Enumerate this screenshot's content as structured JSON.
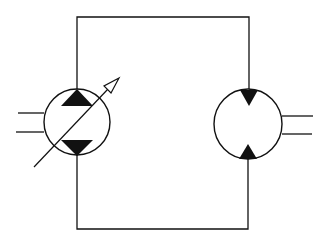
{
  "diagram": {
    "type": "hydraulic-circuit",
    "colors": {
      "stroke": "#111111",
      "fill": "#111111",
      "background": "#ffffff"
    },
    "components": [
      {
        "id": "pump",
        "label": "Variable displacement bidirectional pump",
        "cx": 77,
        "cy": 122,
        "r": 33,
        "triangles": "outward",
        "variable_arrow": true
      },
      {
        "id": "motor",
        "label": "Fixed displacement bidirectional motor",
        "cx": 248,
        "cy": 124,
        "rx": 34,
        "ry": 35,
        "triangles": "inward",
        "variable_arrow": false
      }
    ],
    "connections": [
      {
        "id": "upper-line",
        "from": "pump",
        "to": "motor",
        "y": 17
      },
      {
        "id": "lower-line",
        "from": "pump",
        "to": "motor",
        "y": 229
      }
    ],
    "shafts": [
      {
        "id": "pump-shaft",
        "side": "left"
      },
      {
        "id": "motor-shaft",
        "side": "right"
      }
    ]
  }
}
